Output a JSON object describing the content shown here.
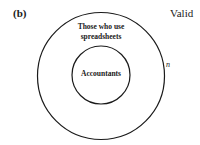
{
  "panel_label": "(b)",
  "verdict": "Valid",
  "outer_set": {
    "label_line1": "Those who use",
    "label_line2": "spreadsheets"
  },
  "inner_set": {
    "label": "Accountants"
  },
  "outer_tag": "n"
}
